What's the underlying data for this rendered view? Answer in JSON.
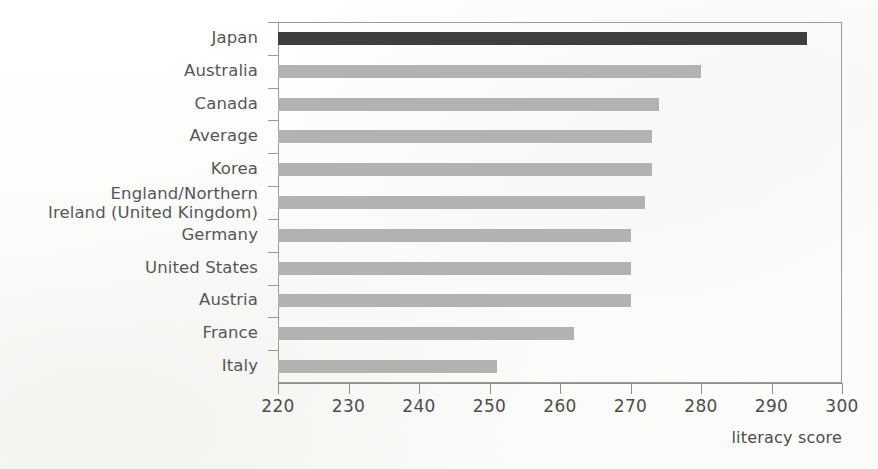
{
  "chart_data": {
    "type": "bar",
    "orientation": "horizontal",
    "title": "",
    "subtitle": "",
    "xlabel": "literacy score",
    "ylabel": "",
    "xlim": [
      220,
      300
    ],
    "ylim": null,
    "grid": false,
    "legend": null,
    "xticks": [
      220,
      230,
      240,
      250,
      260,
      270,
      280,
      290,
      300
    ],
    "xtick_labels": [
      "220",
      "230",
      "240",
      "250",
      "260",
      "270",
      "280",
      "290",
      "300"
    ],
    "categories": [
      "Japan",
      "Australia",
      "Canada",
      "Average",
      "Korea",
      "England/Northern\nIreland (United Kingdom)",
      "Germany",
      "United States",
      "Austria",
      "France",
      "Italy"
    ],
    "values": [
      295,
      280,
      274,
      273,
      273,
      272,
      270,
      270,
      270,
      262,
      251
    ],
    "bar_colors": [
      "#3e3e3e",
      "#b2b2b0",
      "#b2b2b0",
      "#b2b2b0",
      "#b2b2b0",
      "#b2b2b0",
      "#b2b2b0",
      "#b2b2b0",
      "#b2b2b0",
      "#b2b2b0",
      "#b2b2b0"
    ],
    "highlight_category": "Japan",
    "highlight_color": "#3e3e3e",
    "series_color": "#b2b2b0",
    "axis_color": "#8f8f8c",
    "text_color": "#4d4d50"
  },
  "axis": {
    "x_title": "literacy score"
  }
}
